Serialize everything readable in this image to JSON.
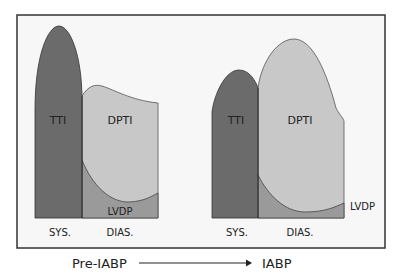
{
  "diagram": {
    "left_panel": {
      "title": "Pre-IABP",
      "labels": {
        "tti": "TTI",
        "dpti": "DPTI",
        "lvdp": "LVDP",
        "sys": "SYS.",
        "dias": "DIAS."
      }
    },
    "right_panel": {
      "title": "IABP",
      "labels": {
        "tti": "TTI",
        "dpti": "DPTI",
        "lvdp": "LVDP",
        "sys": "SYS.",
        "dias": "DIAS."
      }
    },
    "colors": {
      "tti": "#6b6b6b",
      "dpti": "#c8c8c8",
      "lvdp": "#9a9a9a",
      "panel_bg": "#f7f7f7",
      "border": "#333333"
    }
  }
}
